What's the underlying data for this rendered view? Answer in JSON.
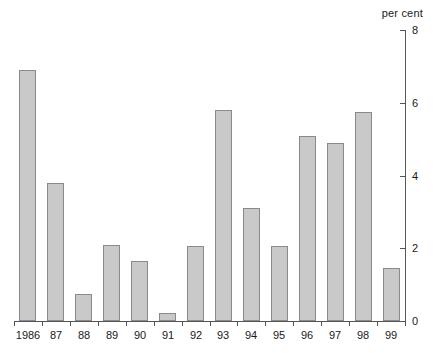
{
  "chart_data": {
    "type": "bar",
    "title": "",
    "subtitle": "",
    "xlabel": "",
    "ylabel": "per cent",
    "unit_label": "per cent",
    "categories": [
      "1986",
      "87",
      "88",
      "89",
      "90",
      "91",
      "92",
      "93",
      "94",
      "95",
      "96",
      "97",
      "98",
      "99"
    ],
    "values": [
      6.9,
      3.8,
      0.75,
      2.1,
      1.65,
      0.22,
      2.05,
      5.8,
      3.1,
      2.05,
      5.1,
      4.9,
      5.75,
      1.45
    ],
    "ylim": [
      0,
      8
    ],
    "yticks": [
      0,
      2,
      4,
      6,
      8
    ],
    "ytick_labels": [
      "0",
      "2",
      "4",
      "6",
      "8"
    ],
    "grid": false,
    "legend": null,
    "y_axis_position": "right",
    "bar_fill_color": "#c9c9c9",
    "bar_border_color": "#8a8a8a",
    "axis_color": "#555555",
    "background_color": "#ffffff"
  }
}
